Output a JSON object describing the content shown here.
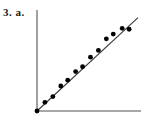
{
  "figure": {
    "label": "3. a.",
    "background_color": "#ffffff"
  },
  "chart_data": {
    "type": "scatter",
    "title": "",
    "subtitle": "",
    "xlabel": "",
    "ylabel": "",
    "x": [
      0.0,
      0.8,
      1.6,
      2.4,
      3.1,
      3.9,
      4.6,
      5.4,
      6.2,
      7.0,
      7.7,
      8.6,
      9.3
    ],
    "y": [
      0.0,
      0.9,
      1.5,
      2.6,
      3.2,
      4.1,
      4.6,
      5.6,
      6.3,
      7.5,
      8.0,
      8.6,
      8.5
    ],
    "xlim": [
      0,
      10.5
    ],
    "ylim": [
      0,
      10.5
    ],
    "grid": false,
    "legend": false,
    "legend_position": "none",
    "point_color": "#000000",
    "point_radius_px": 2.4,
    "series": [
      {
        "name": "data points",
        "marker": "filled-circle",
        "color": "#000000",
        "values": [
          0.0,
          0.9,
          1.5,
          2.6,
          3.2,
          4.1,
          4.6,
          5.6,
          6.3,
          7.5,
          8.0,
          8.6,
          8.5
        ]
      },
      {
        "name": "line of best fit",
        "type": "line",
        "color": "#3a3a3a",
        "slope": 0.95,
        "intercept": 0.0,
        "x_start": 0.0,
        "x_end": 10.2,
        "y_start": 0.0,
        "y_end": 9.7
      }
    ],
    "annotations": [],
    "axes": {
      "color": "#8a8a8a",
      "x_axis": {
        "visible": true,
        "ticks": [],
        "tick_labels": []
      },
      "y_axis": {
        "visible": true,
        "ticks": [],
        "tick_labels": []
      }
    }
  }
}
